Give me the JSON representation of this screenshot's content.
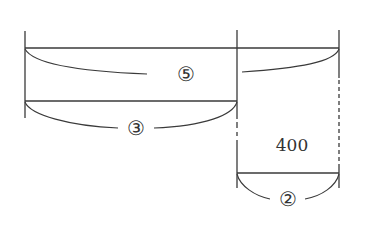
{
  "diagram": {
    "type": "segment-diagram",
    "labels": {
      "total_ratio": "⑤",
      "left_ratio": "③",
      "right_ratio": "②",
      "difference_value": "400"
    },
    "colors": {
      "line": "#3a3a3a",
      "text": "#333333",
      "background": "#ffffff"
    }
  }
}
